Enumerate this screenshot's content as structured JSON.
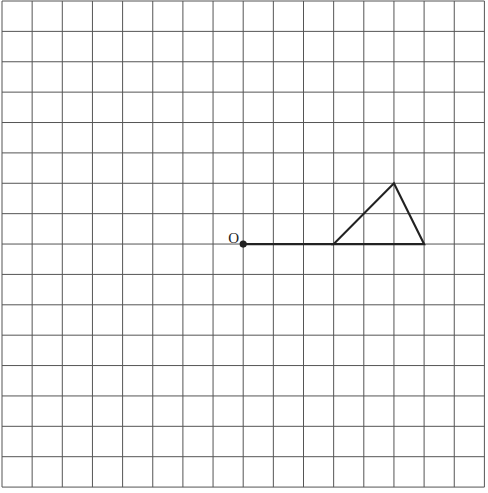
{
  "diagram": {
    "type": "grid-geometry",
    "grid": {
      "columns": 16,
      "rows": 16,
      "origin_px": [
        2,
        1
      ],
      "cell_w": 30.15,
      "cell_h": 30.38,
      "line_color": "#555555"
    },
    "point_O": {
      "label": "O",
      "grid": [
        8,
        8
      ]
    },
    "segment": {
      "from": [
        8,
        8
      ],
      "to": [
        11,
        8
      ]
    },
    "triangle": {
      "vertices": [
        [
          11,
          8
        ],
        [
          14,
          8
        ],
        [
          13,
          6
        ]
      ]
    },
    "stroke_color": "#222222"
  }
}
